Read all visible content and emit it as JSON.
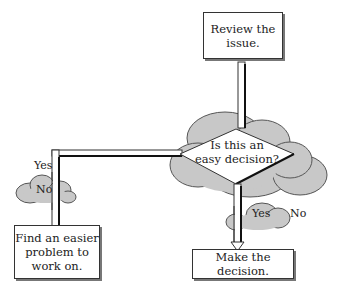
{
  "diagram": {
    "type": "flowchart",
    "nodes": {
      "start": {
        "label": "Review the issue.",
        "line1": "Review the",
        "line2": "issue."
      },
      "decision": {
        "label": "Is this an easy decision?",
        "line1": "Is this an",
        "line2": "easy decision?"
      },
      "no_outcome": {
        "label": "Find an easier problem to work on.",
        "line1": "Find an easier",
        "line2": "problem to",
        "line3": "work on."
      },
      "yes_outcome": {
        "label": "Make the decision."
      }
    },
    "edges": {
      "left": {
        "from": "decision",
        "to": "no_outcome",
        "outside_label": "Yes",
        "cloud_label": "No"
      },
      "down": {
        "from": "decision",
        "to": "yes_outcome",
        "cloud_label": "Yes",
        "outside_label": "No"
      }
    },
    "colors": {
      "cloud_fill": "#c8c8c8",
      "cloud_stroke": "#555555",
      "box_border": "#333333",
      "shadow": "#777777"
    }
  }
}
